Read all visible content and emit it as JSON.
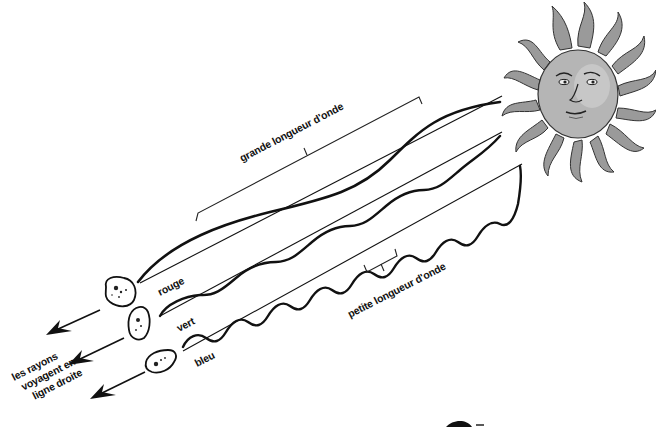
{
  "diagram": {
    "type": "illustration",
    "source_icon": "sun-face-icon",
    "labels": {
      "long_wavelength": "grande longueur d'onde",
      "short_wavelength": "petite longueur d'onde",
      "straight_line_note_line1": "les rayons",
      "straight_line_note_line2": "voyagent en",
      "straight_line_note_line3": "ligne droite"
    },
    "rays": [
      {
        "id": "red",
        "label": "rouge",
        "wavelength": "long",
        "color": "#111111"
      },
      {
        "id": "green",
        "label": "vert",
        "wavelength": "medium",
        "color": "#111111"
      },
      {
        "id": "blue",
        "label": "bleu",
        "wavelength": "short",
        "color": "#111111"
      }
    ],
    "colors": {
      "ink": "#111111",
      "sun_fill": "#9a9a9a",
      "sun_light": "#c8c8c8",
      "background": "#ffffff"
    }
  }
}
